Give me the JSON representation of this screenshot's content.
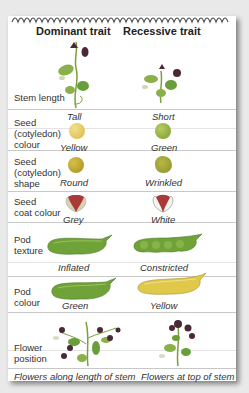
{
  "header": {
    "dominant": "Dominant trait",
    "recessive": "Recessive trait"
  },
  "rows": [
    {
      "label": "Stem length",
      "dominant": "Tall",
      "recessive": "Short"
    },
    {
      "label": "Seed (cotyledon) colour",
      "label_lines": [
        "Seed",
        "(cotyledon)",
        "colour"
      ],
      "dominant": "Yellow",
      "recessive": "Green"
    },
    {
      "label": "Seed (cotyledon) shape",
      "label_lines": [
        "Seed",
        "(cotyledon)",
        "shape"
      ],
      "dominant": "Round",
      "recessive": "Wrinkled"
    },
    {
      "label": "Seed coat colour",
      "label_lines": [
        "Seed",
        "coat colour"
      ],
      "dominant": "Grey",
      "recessive": "White"
    },
    {
      "label": "Pod texture",
      "label_lines": [
        "Pod",
        "texture"
      ],
      "dominant": "Inflated",
      "recessive": "Constricted"
    },
    {
      "label": "Pod colour",
      "label_lines": [
        "Pod",
        "colour"
      ],
      "dominant": "Green",
      "recessive": "Yellow"
    },
    {
      "label": "Flower position",
      "label_lines": [
        "Flower",
        "position"
      ],
      "dominant": "Flowers along length of stem",
      "recessive": "Flowers at top of stem"
    }
  ],
  "colors": {
    "yellow_seed": "#e0c75a",
    "green_seed": "#8ca83c",
    "round_seed": "#b9a02a",
    "wrinkled_seed": "#9aa234",
    "green_pod": "#7aa83a",
    "yellow_pod": "#d9c24a",
    "leaf": "#6a9e3a",
    "flower": "#5a2a4a"
  }
}
